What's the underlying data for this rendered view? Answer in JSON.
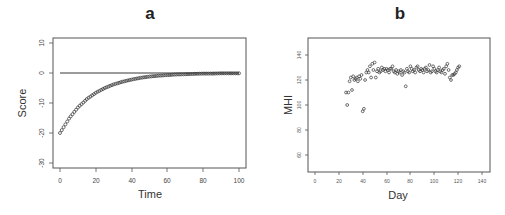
{
  "chart_data": [
    {
      "panel": "a",
      "type": "scatter",
      "title": "a",
      "xlabel": "Time",
      "ylabel": "Score",
      "xlim": [
        0,
        100
      ],
      "ylim": [
        -30,
        10
      ],
      "x_ticks": [
        0,
        20,
        40,
        60,
        80,
        100
      ],
      "y_ticks": [
        -30,
        -20,
        -10,
        0,
        10
      ],
      "grid": false,
      "reference_line": {
        "y": 0,
        "x_from": 0,
        "x_to": 100
      },
      "series": [
        {
          "name": "Score",
          "description": "Exponential approach from -20 toward 0: score = -20*exp(-t/18)",
          "x": [
            0,
            5,
            10,
            15,
            20,
            25,
            30,
            35,
            40,
            45,
            50,
            55,
            60,
            65,
            70,
            75,
            80,
            85,
            90,
            95,
            100
          ],
          "values": [
            -20,
            -15.2,
            -11.5,
            -8.7,
            -6.6,
            -5.0,
            -3.8,
            -2.9,
            -2.2,
            -1.6,
            -1.2,
            -0.9,
            -0.7,
            -0.5,
            -0.4,
            -0.3,
            -0.2,
            -0.2,
            -0.1,
            -0.1,
            -0.1
          ]
        }
      ]
    },
    {
      "panel": "b",
      "type": "scatter",
      "title": "b",
      "xlabel": "Day",
      "ylabel": "MHI",
      "xlim": [
        0,
        140
      ],
      "ylim": [
        50,
        150
      ],
      "x_ticks": [
        0,
        20,
        40,
        60,
        80,
        100,
        120,
        140
      ],
      "y_ticks": [
        60,
        80,
        100,
        120,
        140
      ],
      "grid": false,
      "series": [
        {
          "name": "MHI",
          "x": [
            26,
            27,
            28,
            29,
            30,
            31,
            32,
            33,
            34,
            35,
            36,
            37,
            38,
            39,
            40,
            41,
            42,
            43,
            44,
            45,
            46,
            47,
            48,
            49,
            50,
            51,
            52,
            53,
            54,
            55,
            56,
            57,
            58,
            59,
            60,
            61,
            62,
            63,
            64,
            65,
            66,
            67,
            68,
            69,
            70,
            71,
            72,
            73,
            74,
            75,
            76,
            77,
            78,
            79,
            80,
            81,
            82,
            83,
            84,
            85,
            86,
            87,
            88,
            89,
            90,
            91,
            92,
            93,
            94,
            95,
            96,
            97,
            98,
            99,
            100,
            101,
            102,
            103,
            104,
            105,
            106,
            107,
            108,
            109,
            110,
            111,
            112,
            113,
            114,
            115,
            116,
            117,
            118,
            119,
            120,
            121
          ],
          "values": [
            110,
            100,
            110,
            119,
            122,
            112,
            123,
            120,
            121,
            122,
            119,
            123,
            121,
            124,
            95,
            97,
            120,
            126,
            128,
            126,
            131,
            122,
            133,
            128,
            134,
            122,
            127,
            129,
            126,
            127,
            130,
            128,
            129,
            127,
            129,
            128,
            126,
            129,
            129,
            131,
            127,
            126,
            128,
            125,
            127,
            126,
            128,
            124,
            127,
            126,
            115,
            129,
            127,
            126,
            131,
            129,
            127,
            128,
            126,
            130,
            131,
            128,
            127,
            129,
            128,
            126,
            129,
            130,
            127,
            128,
            132,
            126,
            127,
            131,
            129,
            127,
            126,
            128,
            130,
            127,
            126,
            128,
            129,
            125,
            131,
            133,
            128,
            122,
            120,
            124,
            124,
            125,
            126,
            128,
            130,
            131
          ]
        }
      ]
    }
  ]
}
